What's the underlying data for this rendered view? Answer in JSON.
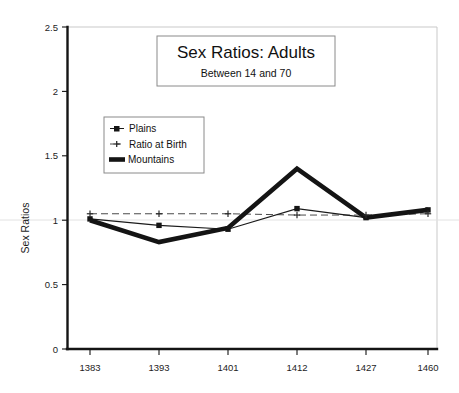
{
  "chart_data": {
    "type": "line",
    "title": "Sex Ratios: Adults",
    "subtitle": "Between 14 and 70",
    "xlabel": "",
    "ylabel": "Sex Ratios",
    "categories": [
      "1383",
      "1393",
      "1401",
      "1412",
      "1427",
      "1460"
    ],
    "ylim": [
      0,
      2.5
    ],
    "yticks": [
      "0",
      "0.5",
      "1",
      "1.5",
      "2",
      "2.5"
    ],
    "ytick_values": [
      0,
      0.5,
      1,
      1.5,
      2,
      2.5
    ],
    "grid": false,
    "legend_position": "upper-left-inside",
    "series": [
      {
        "name": "Plains",
        "marker": "square",
        "style": "thin-solid",
        "values": [
          1.01,
          0.96,
          0.93,
          1.09,
          1.02,
          1.08
        ]
      },
      {
        "name": "Ratio at Birth",
        "marker": "cross",
        "style": "dashed",
        "values": [
          1.05,
          1.05,
          1.05,
          1.04,
          1.04,
          1.05
        ]
      },
      {
        "name": "Mountains",
        "marker": "none",
        "style": "thick-solid",
        "values": [
          1.0,
          0.83,
          0.94,
          1.4,
          1.02,
          1.08
        ]
      }
    ]
  },
  "legend": {
    "items": [
      {
        "label": "Plains",
        "swatch": "square-marker-swatch"
      },
      {
        "label": "Ratio at Birth",
        "swatch": "cross-marker-swatch"
      },
      {
        "label": "Mountains",
        "swatch": "thick-line-swatch"
      }
    ]
  },
  "colors": {
    "ink": "#141414",
    "frame": "#8a8a8a",
    "plot_border": "#c9c9c9",
    "background": "#ffffff",
    "dash_series": "#4a4a4a"
  }
}
